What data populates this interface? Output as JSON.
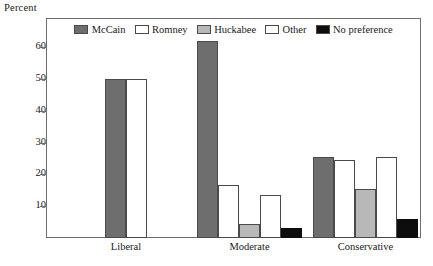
{
  "chart_data": {
    "type": "bar",
    "title": "",
    "ylabel": "Percent",
    "xlabel": "",
    "ylim": [
      0,
      66
    ],
    "yticks": [
      10,
      20,
      30,
      40,
      50,
      60
    ],
    "ytick_labels": [
      "10",
      "20",
      "30",
      "40",
      "50",
      "60"
    ],
    "grid": false,
    "legend_position": "top-center",
    "categories": [
      "Liberal",
      "Moderate",
      "Conservative"
    ],
    "series": [
      {
        "name": "McCain",
        "color": "#6e6e6e",
        "values": [
          50,
          62,
          25.5
        ]
      },
      {
        "name": "Romney",
        "color": "#ffffff",
        "values": [
          50,
          16.5,
          24.5
        ]
      },
      {
        "name": "Huckabee",
        "color": "#b8b8b8",
        "values": [
          null,
          4.5,
          15.5
        ]
      },
      {
        "name": "Other",
        "color": "#ffffff",
        "values": [
          null,
          13.5,
          25.5
        ]
      },
      {
        "name": "No preference",
        "color": "#0d0d0d",
        "values": [
          null,
          3.0,
          6.0
        ]
      }
    ]
  },
  "axis": {
    "y_caption": "Percent"
  },
  "colors": {
    "mccain": "#6e6e6e",
    "romney": "#ffffff",
    "huckabee": "#b8b8b8",
    "other": "#ffffff",
    "no_preference": "#0d0d0d",
    "frame": "#6e6e6e",
    "bar_outline": "#4a4a4a"
  }
}
